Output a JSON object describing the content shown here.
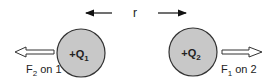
{
  "diagram": {
    "separation_label": "r",
    "charge1": {
      "label": "+Q",
      "subscript": "1",
      "fill": "#c8c8c8"
    },
    "charge2": {
      "label": "+Q",
      "subscript": "2",
      "fill": "#c8c8c8"
    },
    "force_on_1": {
      "label_main": "F",
      "label_sub": "2",
      "label_rest": " on 1",
      "direction": "left"
    },
    "force_on_2": {
      "label_main": "F",
      "label_sub": "1",
      "label_rest": " on 2",
      "direction": "right"
    }
  }
}
